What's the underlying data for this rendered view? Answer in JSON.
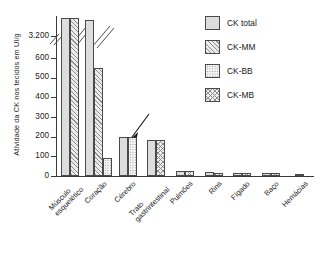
{
  "chart_data": {
    "type": "bar",
    "title": "",
    "xlabel": "",
    "ylabel": "Atividade da CK nos tecidos em UI/g",
    "ylim": [
      0,
      3200
    ],
    "y_ticks": [
      "0",
      "100",
      "200",
      "300",
      "400",
      "500",
      "600",
      "3.200"
    ],
    "y_tick_values": [
      0,
      100,
      200,
      300,
      400,
      500,
      600,
      3200
    ],
    "axis_break": true,
    "axis_break_between": [
      600,
      3200
    ],
    "grid": false,
    "legend_position": "right",
    "categories": [
      "Músculo esquelético",
      "Coração",
      "Cérebro",
      "Trato gastrintestinal",
      "Pulmões",
      "Rins",
      "Fígado",
      "Baço",
      "Hemácias"
    ],
    "series": [
      {
        "name": "CK total",
        "pattern": "solid",
        "values": [
          3200,
          3050,
          200,
          185,
          25,
          22,
          14,
          13,
          7
        ]
      },
      {
        "name": "CK-MM",
        "pattern": "diagonal",
        "values": [
          3200,
          550,
          null,
          null,
          null,
          13,
          null,
          null,
          null
        ]
      },
      {
        "name": "CK-BB",
        "pattern": "dots",
        "values": [
          null,
          90,
          200,
          null,
          null,
          null,
          null,
          null,
          null
        ]
      },
      {
        "name": "CK-MB",
        "pattern": "crosshatch",
        "values": [
          null,
          null,
          null,
          185,
          25,
          null,
          14,
          13,
          null
        ]
      }
    ],
    "annotations": [
      {
        "type": "arrow",
        "target_category": "Coração",
        "target_series": "CK-BB",
        "target_value": 90
      }
    ]
  },
  "legend": {
    "items": [
      {
        "label": "CK total",
        "pattern": "total"
      },
      {
        "label": "CK-MM",
        "pattern": "mm"
      },
      {
        "label": "CK-BB",
        "pattern": "bb"
      },
      {
        "label": "CK-MB",
        "pattern": "mb"
      }
    ]
  },
  "axes": {
    "y_title": "Atividade da CK nos tecidos em UI/g"
  },
  "colors": {
    "axis": "#3a3a3a",
    "bar_outline": "#4a4a4a",
    "bar_fill": "#dddddd",
    "pattern_ink": "#8a8a8a",
    "text": "#1a1a1a",
    "background": "#ffffff"
  }
}
